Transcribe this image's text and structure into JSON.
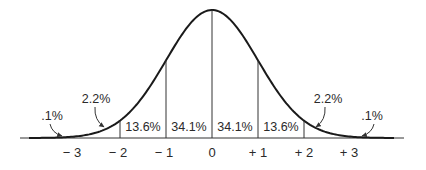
{
  "chart_data": {
    "type": "area",
    "title": "",
    "subtitle": "",
    "xlabel": "",
    "ylabel": "",
    "x_ticks": [
      "-3",
      "-2",
      "-1",
      "0",
      "+1",
      "+2",
      "+3"
    ],
    "x_tick_labels": [
      "− 3",
      "− 2",
      "− 1",
      "0",
      "+ 1",
      "+ 2",
      "+ 3"
    ],
    "xlim": [
      -4,
      4
    ],
    "grid": false,
    "legend": null,
    "bands": [
      {
        "range": "< -3",
        "label": ".1%",
        "value": 0.1
      },
      {
        "range": "-3 to -2",
        "label": "2.2%",
        "value": 2.2
      },
      {
        "range": "-2 to -1",
        "label": "13.6%",
        "value": 13.6
      },
      {
        "range": "-1 to 0",
        "label": "34.1%",
        "value": 34.1
      },
      {
        "range": "0 to +1",
        "label": "34.1%",
        "value": 34.1
      },
      {
        "range": "+1 to +2",
        "label": "13.6%",
        "value": 13.6
      },
      {
        "range": "+2 to +3",
        "label": "2.2%",
        "value": 2.2
      },
      {
        "range": "> +3",
        "label": ".1%",
        "value": 0.1
      }
    ],
    "categories": [
      "<-3",
      "-3..-2",
      "-2..-1",
      "-1..0",
      "0..+1",
      "+1..+2",
      "+2..+3",
      ">+3"
    ],
    "values": [
      0.1,
      2.2,
      13.6,
      34.1,
      34.1,
      13.6,
      2.2,
      0.1
    ],
    "annotations": [
      {
        "text": ".1%",
        "position": "left tail",
        "arrow": true
      },
      {
        "text": "2.2%",
        "position": "between -3 and -2",
        "arrow": true
      },
      {
        "text": "2.2%",
        "position": "between +2 and +3",
        "arrow": true
      },
      {
        "text": ".1%",
        "position": "right tail",
        "arrow": true
      }
    ]
  },
  "colors": {
    "line": "#1a1a1a",
    "text": "#2a2a2a",
    "background": "#ffffff"
  }
}
